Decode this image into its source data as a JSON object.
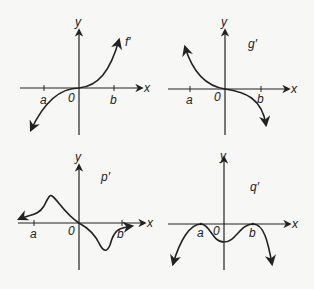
{
  "graphs": [
    {
      "id": "f",
      "label": "f′",
      "axis_x": "x",
      "axis_y": "y",
      "origin": "0",
      "tick_a": "a",
      "tick_b": "b",
      "shape": "increasing cubic-like through origin"
    },
    {
      "id": "g",
      "label": "g′",
      "axis_x": "x",
      "axis_y": "y",
      "origin": "0",
      "tick_a": "a",
      "tick_b": "b",
      "shape": "decreasing cubic-like through origin"
    },
    {
      "id": "p",
      "label": "p′",
      "axis_x": "x",
      "axis_y": "y",
      "origin": "0",
      "tick_a": "a",
      "tick_b": "b",
      "shape": "positive bump left of origin, negative dip right of origin"
    },
    {
      "id": "q",
      "label": "q′",
      "axis_x": "x",
      "axis_y": "y",
      "origin": "0",
      "tick_a": "a",
      "tick_b": "b",
      "shape": "touches zero at a and b, negative elsewhere"
    }
  ],
  "colors": {
    "stroke": "#222222",
    "background": "#f7f7f5"
  }
}
